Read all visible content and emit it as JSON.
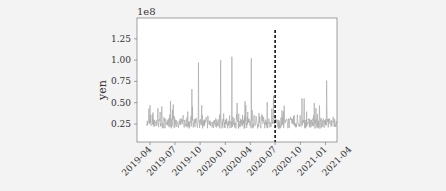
{
  "chart_data": {
    "type": "line",
    "title": "",
    "xlabel": "",
    "ylabel": "yen",
    "y_offset_label": "1e8",
    "ylim": [
      0.0,
      1.5
    ],
    "y_ticks": [
      0.25,
      0.5,
      0.75,
      1.0,
      1.25
    ],
    "y_tick_labels": [
      "0.25",
      "0.50",
      "0.75",
      "1.00",
      "1.25"
    ],
    "x_tick_labels": [
      "2019-04",
      "2019-07",
      "2019-10",
      "2020-01",
      "2020-04",
      "2020-07",
      "2020-10",
      "2021-01",
      "2021-04"
    ],
    "grid": false,
    "legend": null,
    "series": [
      {
        "name": "daily value",
        "color": "#aaaaaa",
        "x_range": [
          "2019-03-20",
          "2021-02-10"
        ],
        "approx_baseline": 0.25,
        "notable_peaks": [
          {
            "x": "2019-04-01",
            "y": 0.47
          },
          {
            "x": "2019-06-15",
            "y": 0.52
          },
          {
            "x": "2019-09-01",
            "y": 0.66
          },
          {
            "x": "2019-09-25",
            "y": 0.97
          },
          {
            "x": "2019-12-15",
            "y": 1.0
          },
          {
            "x": "2020-01-25",
            "y": 1.04
          },
          {
            "x": "2020-04-05",
            "y": 1.02
          },
          {
            "x": "2020-06-25",
            "y": 0.58
          },
          {
            "x": "2020-10-15",
            "y": 0.55
          },
          {
            "x": "2021-01-05",
            "y": 0.76
          }
        ]
      }
    ],
    "annotations": [
      {
        "type": "vertical-dashed-line",
        "x": "2020-07-01",
        "color": "#000000"
      }
    ]
  },
  "colors": {
    "background": "#f3f3f3",
    "plot_area": "#ffffff",
    "frame": "#888888",
    "series": "#aaaaaa",
    "marker_line": "#111111"
  }
}
